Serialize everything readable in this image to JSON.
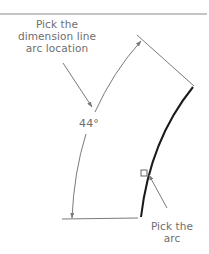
{
  "diagram": {
    "callouts": {
      "dimension_line": {
        "lines": [
          "Pick the",
          "dimension line",
          "arc location"
        ]
      },
      "arc": {
        "lines": [
          "Pick the",
          "arc"
        ]
      }
    },
    "dimension": {
      "angle_label": "44°"
    },
    "colors": {
      "geometry": "#1a1a1a",
      "annotation": "#7a7a7a",
      "text": "#6e6e6e",
      "rule": "#8a8a8a"
    }
  }
}
